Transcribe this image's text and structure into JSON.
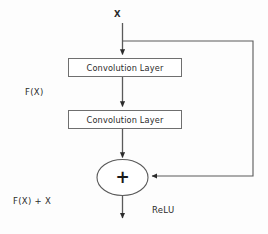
{
  "diagram": {
    "background_color": "#fdfdfd",
    "stroke_color": "#5a5a5a",
    "text_color": "#2b2b2b",
    "labels": {
      "input": "X",
      "residual_function": "F(X)",
      "output_sum": "F(X) + X",
      "activation": "ReLU",
      "adder_symbol": "+"
    },
    "blocks": [
      {
        "id": "conv1",
        "label": "Convolution Layer"
      },
      {
        "id": "conv2",
        "label": "Convolution Layer"
      }
    ],
    "nodes": [
      {
        "id": "adder",
        "type": "ellipse",
        "label": "+"
      }
    ],
    "edges": [
      {
        "from": "X",
        "to": "conv1",
        "type": "arrow"
      },
      {
        "from": "conv1",
        "to": "conv2",
        "type": "arrow"
      },
      {
        "from": "conv2",
        "to": "adder",
        "type": "arrow"
      },
      {
        "from": "X",
        "to": "adder",
        "type": "skip-connection"
      },
      {
        "from": "adder",
        "to": "output",
        "type": "arrow"
      }
    ]
  }
}
